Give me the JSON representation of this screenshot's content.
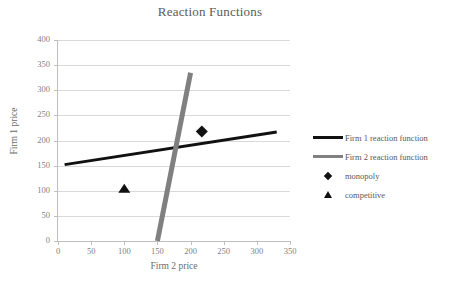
{
  "chart_data": {
    "type": "line",
    "title": "Reaction Functions",
    "xlabel": "Firm 2 price",
    "ylabel": "Firm 1 price",
    "xlim": [
      0,
      350
    ],
    "ylim": [
      0,
      400
    ],
    "xticks": [
      0,
      50,
      100,
      150,
      200,
      250,
      300,
      350
    ],
    "yticks": [
      0,
      50,
      100,
      150,
      200,
      250,
      300,
      350,
      400
    ],
    "grid": "horizontal",
    "legend_position": "right",
    "series": [
      {
        "name": "Firm 1 reaction function",
        "type": "line",
        "color": "#111111",
        "width": 3,
        "points": [
          [
            10,
            152
          ],
          [
            330,
            217
          ]
        ]
      },
      {
        "name": "Firm 2 reaction function",
        "type": "line",
        "color": "#808080",
        "width": 5,
        "points": [
          [
            150,
            0
          ],
          [
            200,
            335
          ]
        ]
      },
      {
        "name": "monopoly",
        "type": "scatter",
        "marker": "diamond",
        "color": "#111111",
        "points": [
          [
            217,
            218
          ]
        ]
      },
      {
        "name": "competitive",
        "type": "scatter",
        "marker": "triangle",
        "color": "#111111",
        "points": [
          [
            100,
            100
          ]
        ]
      }
    ]
  },
  "legend": {
    "items": [
      {
        "label": "Firm 1 reaction function",
        "key": "line-dark"
      },
      {
        "label": "Firm 2 reaction function",
        "key": "line-grey"
      },
      {
        "label": "monopoly",
        "key": "marker-diamond"
      },
      {
        "label": "competitive",
        "key": "marker-triangle"
      }
    ]
  },
  "axes": {
    "x_tick_labels": [
      "0",
      "50",
      "100",
      "150",
      "200",
      "250",
      "300",
      "350"
    ],
    "y_tick_labels": [
      "0",
      "50",
      "100",
      "150",
      "200",
      "250",
      "300",
      "350",
      "400"
    ]
  }
}
